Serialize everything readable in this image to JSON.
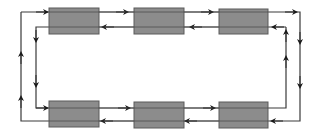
{
  "diagram": {
    "type": "dual-ring-bus",
    "colors": {
      "background": "#ffffff",
      "node_fill": "#8c8c8c",
      "node_stroke": "#5a5a5a",
      "line": "#3a3a3a",
      "arrow": "#1a1a1a"
    },
    "nodes": [
      {
        "id": "node-1",
        "row": "top",
        "col": 1,
        "x": 49,
        "y": 8,
        "w": 50,
        "h": 26
      },
      {
        "id": "node-2",
        "row": "top",
        "col": 2,
        "x": 134,
        "y": 8,
        "w": 50,
        "h": 26
      },
      {
        "id": "node-3",
        "row": "top",
        "col": 3,
        "x": 219,
        "y": 9,
        "w": 49,
        "h": 25
      },
      {
        "id": "node-4",
        "row": "bottom",
        "col": 1,
        "x": 49,
        "y": 101,
        "w": 50,
        "h": 26
      },
      {
        "id": "node-5",
        "row": "bottom",
        "col": 2,
        "x": 134,
        "y": 102,
        "w": 50,
        "h": 26
      },
      {
        "id": "node-6",
        "row": "bottom",
        "col": 3,
        "x": 219,
        "y": 102,
        "w": 49,
        "h": 26
      }
    ],
    "rings": [
      {
        "name": "outer-ring",
        "direction": "clockwise",
        "left_x": 21,
        "right_x": 300,
        "top_y": 12,
        "bottom_y": 121
      },
      {
        "name": "inner-ring",
        "direction": "counter-clockwise",
        "left_x": 36,
        "right_x": 286,
        "top_y": 27,
        "bottom_y": 108
      }
    ]
  }
}
